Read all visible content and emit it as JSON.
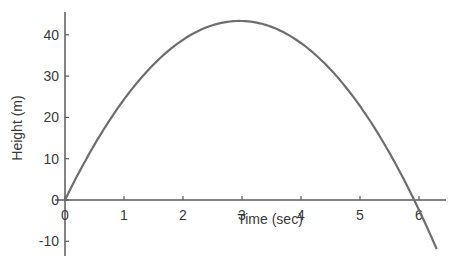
{
  "chart_data": {
    "type": "line",
    "title": "",
    "xlabel": "Time (sec)",
    "ylabel": "Height (m)",
    "xlim": [
      0,
      6.4
    ],
    "ylim": [
      -12,
      46
    ],
    "x_ticks": [
      0,
      1,
      2,
      3,
      4,
      5,
      6
    ],
    "y_ticks": [
      -10,
      0,
      10,
      20,
      30,
      40
    ],
    "grid": false,
    "legend": null,
    "series": [
      {
        "name": "height",
        "x": [
          0,
          0.5,
          1,
          1.5,
          2,
          2.5,
          3,
          3.5,
          4,
          4.5,
          5,
          5.5,
          5.9,
          6,
          6.3
        ],
        "values": [
          0,
          13.5,
          24.6,
          32.7,
          38.7,
          42.2,
          43.4,
          42.2,
          38.7,
          32.7,
          24.6,
          13.5,
          0.5,
          -2.5,
          -12.6
        ]
      }
    ],
    "line_color": "#6e6e6e"
  },
  "labels": {
    "xlabel": "Time (sec)",
    "ylabel": "Height (m)",
    "x_ticks": [
      "0",
      "1",
      "2",
      "3",
      "4",
      "5",
      "6"
    ],
    "y_ticks": [
      "-10",
      "0",
      "10",
      "20",
      "30",
      "40"
    ]
  }
}
